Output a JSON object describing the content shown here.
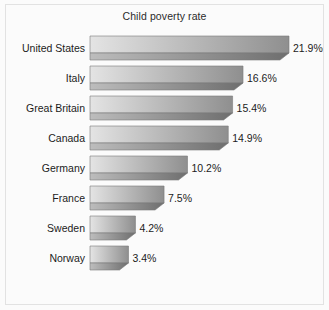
{
  "chart_data": {
    "type": "bar",
    "orientation": "horizontal",
    "title": "Child poverty rate",
    "xlabel": "",
    "ylabel": "",
    "grid": false,
    "legend": null,
    "xlim": [
      0,
      21.9
    ],
    "value_suffix": "%",
    "categories": [
      "United States",
      "Italy",
      "Great Britain",
      "Canada",
      "Germany",
      "France",
      "Sweden",
      "Norway"
    ],
    "values": [
      21.9,
      16.6,
      15.4,
      14.9,
      10.2,
      7.5,
      4.2,
      3.4
    ],
    "value_labels": [
      "21.9%",
      "16.6%",
      "15.4%",
      "14.9%",
      "10.2%",
      "7.5%",
      "4.2%",
      "3.4%"
    ]
  },
  "style": {
    "background": "#fbfbfb",
    "border_color": "#e2e2e2",
    "text_color": "#1c1c1c",
    "bar_face_light": "#e4e4e4",
    "bar_face_dark": "#8f8f8f",
    "bar_shade_light": "#bdbdbd",
    "bar_shade_dark": "#6e6e6e",
    "bar_edge": "#7a7a7a"
  }
}
